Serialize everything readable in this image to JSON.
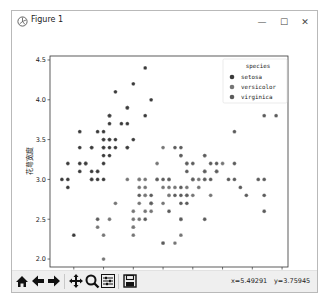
{
  "window": {
    "title": "Figure 1",
    "controls": [
      "minimize-icon",
      "maximize-icon",
      "close-icon"
    ],
    "control_glyphs": {
      "minimize": "—",
      "maximize": "☐",
      "close": "✕"
    }
  },
  "toolbar": {
    "buttons": [
      "home-icon",
      "back-icon",
      "forward-icon",
      "pan-icon",
      "zoom-icon",
      "configure-subplots-icon",
      "save-icon"
    ],
    "coords_x": "x=5.49291",
    "coords_y": "y=3.75945"
  },
  "colors": {
    "setosa": "#3b3b3b",
    "versicolor": "#767676",
    "virginica": "#5c5c5c",
    "axis": "#333333",
    "toolbar_bg": "#efefef"
  },
  "chart_data": {
    "type": "scatter",
    "title": "",
    "xlabel": "花萼长度",
    "ylabel": "花萼宽度",
    "xlim": [
      4.1,
      8.1
    ],
    "ylim": [
      1.9,
      4.55
    ],
    "xticks": [
      4.5,
      5.0,
      5.5,
      6.0,
      6.5,
      7.0,
      7.5,
      8.0
    ],
    "yticks": [
      2.0,
      2.5,
      3.0,
      3.5,
      4.0,
      4.5
    ],
    "xtick_labels": [
      "4.5",
      "5.0",
      "5.5",
      "6.0",
      "6.5",
      "7.0",
      "7.5",
      "8.0"
    ],
    "ytick_labels": [
      "2.0",
      "2.5",
      "3.0",
      "3.5",
      "4.0",
      "4.5"
    ],
    "grid": false,
    "legend": {
      "title": "species",
      "position": "upper right",
      "entries": [
        "setosa",
        "versicolor",
        "virginica"
      ]
    },
    "series": [
      {
        "name": "setosa",
        "x": [
          5.1,
          4.9,
          4.7,
          4.6,
          5.0,
          5.4,
          4.6,
          5.0,
          4.4,
          4.9,
          5.4,
          4.8,
          4.8,
          4.3,
          5.8,
          5.7,
          5.4,
          5.1,
          5.7,
          5.1,
          5.4,
          5.1,
          4.6,
          5.1,
          4.8,
          5.0,
          5.0,
          5.2,
          5.2,
          4.7,
          4.8,
          5.4,
          5.2,
          5.5,
          4.9,
          5.0,
          5.5,
          4.9,
          4.4,
          5.1,
          5.0,
          4.5,
          4.4,
          5.0,
          5.1,
          4.8,
          5.1,
          4.6,
          5.3,
          5.0
        ],
        "y": [
          3.5,
          3.0,
          3.2,
          3.1,
          3.6,
          3.9,
          3.4,
          3.4,
          2.9,
          3.1,
          3.7,
          3.4,
          3.0,
          3.0,
          4.0,
          4.4,
          3.9,
          3.5,
          3.8,
          3.8,
          3.4,
          3.7,
          3.6,
          3.3,
          3.4,
          3.0,
          3.4,
          3.5,
          3.4,
          3.2,
          3.1,
          3.4,
          4.1,
          4.2,
          3.1,
          3.2,
          3.5,
          3.6,
          3.0,
          3.4,
          3.5,
          2.3,
          3.2,
          3.5,
          3.8,
          3.0,
          3.8,
          3.2,
          3.7,
          3.3
        ]
      },
      {
        "name": "versicolor",
        "x": [
          7.0,
          6.4,
          6.9,
          5.5,
          6.5,
          5.7,
          6.3,
          4.9,
          6.6,
          5.2,
          5.0,
          5.9,
          6.0,
          6.1,
          5.6,
          6.7,
          5.6,
          5.8,
          6.2,
          5.6,
          5.9,
          6.1,
          6.3,
          6.1,
          6.4,
          6.6,
          6.8,
          6.7,
          6.0,
          5.7,
          5.5,
          5.5,
          5.8,
          6.0,
          5.4,
          6.0,
          6.7,
          6.3,
          5.6,
          5.5,
          5.5,
          6.1,
          5.8,
          5.0,
          5.6,
          5.7,
          5.7,
          6.2,
          5.1,
          5.7
        ],
        "y": [
          3.2,
          3.2,
          3.1,
          2.3,
          2.8,
          2.8,
          3.3,
          2.4,
          2.9,
          2.7,
          2.0,
          3.0,
          2.2,
          2.9,
          2.9,
          3.1,
          3.0,
          2.7,
          2.2,
          2.5,
          3.2,
          2.8,
          2.5,
          2.8,
          2.9,
          3.0,
          2.8,
          3.0,
          2.9,
          2.6,
          2.4,
          2.4,
          2.7,
          2.7,
          3.0,
          3.4,
          3.1,
          2.3,
          3.0,
          2.5,
          2.6,
          3.0,
          2.6,
          2.3,
          2.7,
          3.0,
          2.9,
          2.9,
          2.5,
          2.8
        ]
      },
      {
        "name": "virginica",
        "x": [
          6.3,
          5.8,
          7.1,
          6.3,
          6.5,
          7.6,
          4.9,
          7.3,
          6.7,
          7.2,
          6.5,
          6.4,
          6.8,
          5.7,
          5.8,
          6.4,
          6.5,
          7.7,
          7.7,
          6.0,
          6.9,
          5.6,
          7.7,
          6.3,
          6.7,
          7.2,
          6.2,
          6.1,
          6.4,
          7.2,
          7.4,
          7.9,
          6.4,
          6.3,
          6.1,
          7.7,
          6.3,
          6.4,
          6.0,
          6.9,
          6.7,
          6.9,
          5.8,
          6.8,
          6.7,
          6.7,
          6.3,
          6.5,
          6.2,
          5.9
        ],
        "y": [
          3.3,
          2.7,
          3.0,
          2.9,
          3.0,
          3.0,
          2.5,
          2.9,
          2.5,
          3.6,
          3.2,
          2.7,
          3.0,
          2.5,
          2.8,
          3.2,
          3.0,
          3.8,
          2.6,
          2.2,
          3.2,
          2.8,
          2.8,
          2.7,
          3.3,
          3.2,
          2.8,
          3.0,
          2.8,
          3.0,
          2.8,
          3.8,
          2.8,
          2.8,
          2.6,
          3.0,
          3.4,
          3.1,
          3.0,
          3.1,
          3.1,
          3.1,
          2.7,
          3.2,
          3.3,
          3.0,
          2.5,
          3.0,
          3.4,
          3.0
        ]
      }
    ]
  }
}
